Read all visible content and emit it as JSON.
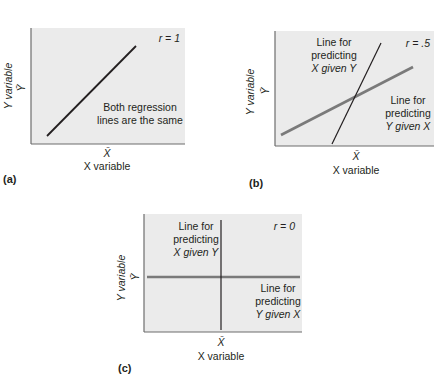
{
  "figure": {
    "panels": [
      {
        "id": "a",
        "tag": "(a)",
        "r_label": "r = 1",
        "y_axis_label": "Y variable",
        "x_axis_label": "X variable",
        "y_mean_label": "Ȳ",
        "x_mean_label": "X̄",
        "annotations": [
          "Both regression",
          "lines are the same"
        ]
      },
      {
        "id": "b",
        "tag": "(b)",
        "r_label": "r = .5",
        "y_axis_label": "Y variable",
        "x_axis_label": "X variable",
        "y_mean_label": "Ȳ",
        "x_mean_label": "X̄",
        "line_x_given_y": [
          "Line for",
          "predicting",
          "X given Y"
        ],
        "line_y_given_x": [
          "Line for",
          "predicting",
          "Y given X"
        ]
      },
      {
        "id": "c",
        "tag": "(c)",
        "r_label": "r = 0",
        "y_axis_label": "Y variable",
        "x_axis_label": "X variable",
        "y_mean_label": "Ȳ",
        "x_mean_label": "X̄",
        "line_x_given_y": [
          "Line for",
          "predicting",
          "X given Y"
        ],
        "line_y_given_x": [
          "Line for",
          "predicting",
          "Y given X"
        ]
      }
    ],
    "colors": {
      "plot_background": "#ebebeb",
      "axis": "#231f20",
      "x_given_y_line": "#231f20",
      "y_given_x_line": "#7a7a7a",
      "text": "#231f20"
    }
  }
}
